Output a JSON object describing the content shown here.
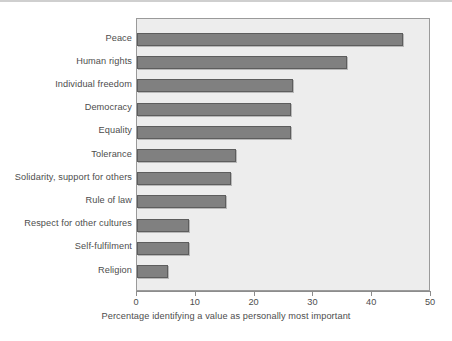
{
  "chart_data": {
    "type": "bar",
    "orientation": "horizontal",
    "title": "",
    "subtitle": "",
    "xlabel": "Percentage identifying a value as personally most important",
    "ylabel": "",
    "xlim": [
      0,
      50
    ],
    "xticks": [
      0,
      10,
      20,
      30,
      40,
      50
    ],
    "xtick_labels": [
      "0",
      "10",
      "20",
      "30",
      "40",
      "50"
    ],
    "grid": false,
    "legend": null,
    "bar_color": "#808080",
    "bar_edge_color": "#5d5d5d",
    "plot_background": "#ededed",
    "categories": [
      "Peace",
      "Human rights",
      "Individual freedom",
      "Democracy",
      "Equality",
      "Tolerance",
      "Solidarity, support for others",
      "Rule of law",
      "Respect for other cultures",
      "Self-fulfilment",
      "Religion"
    ],
    "values": [
      45.2,
      35.7,
      26.5,
      26.2,
      26.2,
      16.8,
      16.0,
      15.1,
      8.8,
      8.8,
      5.2
    ]
  }
}
